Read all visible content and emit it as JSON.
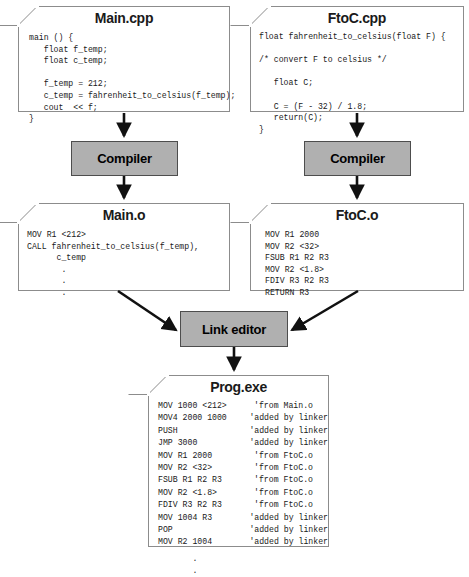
{
  "diagram": {
    "colors": {
      "process_fill": "#b0b0b0",
      "process_border": "#4d4d4d",
      "doc_border": "#8c8c8c",
      "arrow": "#111111",
      "text": "#1a1a1a"
    }
  },
  "nodes": {
    "main_cpp": {
      "title": "Main.cpp",
      "code": "main () {\n   float f_temp;\n   float c_temp;\n\n   f_temp = 212;\n   c_temp = fahrenheit_to_celsius(f_temp);\n   cout  << f;\n}"
    },
    "ftoc_cpp": {
      "title": "FtoC.cpp",
      "code": "float fahrenheit_to_celsius(float F) {\n\n/* convert F to celsius */\n\n   float C;\n\n   C = (F - 32) / 1.8;\n   return(C);\n}"
    },
    "compiler_left": {
      "label": "Compiler"
    },
    "compiler_right": {
      "label": "Compiler"
    },
    "main_o": {
      "title": "Main.o",
      "code": "MOV R1 <212>\nCALL fahrenheit_to_celsius(f_temp),\n      c_temp\n       .\n       .\n       ."
    },
    "ftoc_o": {
      "title": "FtoC.o",
      "code": "MOV R1 2000\nMOV R2 <32>\nFSUB R1 R2 R3\nMOV R2 <1.8>\nFDIV R3 R2 R3\nRETURN R3"
    },
    "link_editor": {
      "label": "Link editor"
    },
    "prog_exe": {
      "title": "Prog.exe",
      "rows": [
        {
          "op": "MOV 1000 <212>",
          "comment": "'from Main.o"
        },
        {
          "op": "MOV4 2000 1000",
          "comment": "'added by linker"
        },
        {
          "op": "PUSH",
          "comment": "'added by linker"
        },
        {
          "op": "JMP 3000",
          "comment": "'added by linker"
        },
        {
          "op": "MOV R1 2000",
          "comment": "'from FtoC.o"
        },
        {
          "op": "MOV R2 <32>",
          "comment": "'from FtoC.o"
        },
        {
          "op": "FSUB R1 R2 R3",
          "comment": "'from FtoC.o"
        },
        {
          "op": "MOV R2 <1.8>",
          "comment": "'from FtoC.o"
        },
        {
          "op": "FDIV R3 R2 R3",
          "comment": "'from FtoC.o"
        },
        {
          "op": "MOV 1004 R3",
          "comment": "'added by linker"
        },
        {
          "op": "POP",
          "comment": "'added by linker"
        },
        {
          "op": "MOV R2 1004",
          "comment": "'added by linker"
        }
      ],
      "trailing_dots": "       .\n       ."
    }
  },
  "edges": [
    {
      "name": "main-cpp-to-compiler-left",
      "from": "main_cpp",
      "to": "compiler_left",
      "kind": "vertical"
    },
    {
      "name": "compiler-left-to-main-o",
      "from": "compiler_left",
      "to": "main_o",
      "kind": "vertical"
    },
    {
      "name": "ftoc-cpp-to-compiler-right",
      "from": "ftoc_cpp",
      "to": "compiler_right",
      "kind": "vertical"
    },
    {
      "name": "compiler-right-to-ftoc-o",
      "from": "compiler_right",
      "to": "ftoc_o",
      "kind": "vertical"
    },
    {
      "name": "main-o-to-link-editor",
      "from": "main_o",
      "to": "link_editor",
      "kind": "diagonal"
    },
    {
      "name": "ftoc-o-to-link-editor",
      "from": "ftoc_o",
      "to": "link_editor",
      "kind": "diagonal"
    },
    {
      "name": "link-editor-to-prog-exe",
      "from": "link_editor",
      "to": "prog_exe",
      "kind": "vertical"
    }
  ]
}
